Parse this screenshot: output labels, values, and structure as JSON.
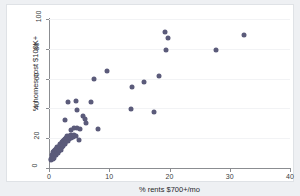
{
  "chart_data": {
    "type": "scatter",
    "title": "",
    "xlabel": "% rents $700+/mo",
    "ylabel": "% homes cost $100K+",
    "xlim": [
      0,
      40
    ],
    "ylim": [
      0,
      100
    ],
    "xticks": [
      0,
      10,
      20,
      30,
      40
    ],
    "yticks": [
      0,
      20,
      40,
      60,
      80,
      100
    ],
    "xtick_labels": [
      "0",
      "10",
      "20",
      "30",
      "40"
    ],
    "ytick_labels": [
      "0",
      "20",
      "40",
      "60",
      "80",
      "100"
    ],
    "grid": "horizontal-faint",
    "legend": "none",
    "marker_color": "#5b5b7a",
    "marker_size_px": 5,
    "points": [
      [
        0.3,
        5.5
      ],
      [
        0.4,
        6.2
      ],
      [
        0.5,
        7.0
      ],
      [
        0.5,
        8.5
      ],
      [
        0.6,
        6.0
      ],
      [
        0.6,
        9.3
      ],
      [
        0.7,
        7.6
      ],
      [
        0.7,
        10.5
      ],
      [
        0.8,
        8.2
      ],
      [
        0.8,
        11.4
      ],
      [
        0.9,
        9.0
      ],
      [
        0.9,
        6.8
      ],
      [
        1.0,
        10.0
      ],
      [
        1.0,
        12.3
      ],
      [
        1.1,
        8.8
      ],
      [
        1.1,
        11.0
      ],
      [
        1.2,
        9.6
      ],
      [
        1.2,
        13.0
      ],
      [
        1.3,
        10.8
      ],
      [
        1.3,
        12.0
      ],
      [
        1.4,
        11.6
      ],
      [
        1.4,
        14.0
      ],
      [
        1.5,
        10.2
      ],
      [
        1.5,
        12.8
      ],
      [
        1.6,
        13.6
      ],
      [
        1.6,
        11.2
      ],
      [
        1.7,
        14.4
      ],
      [
        1.7,
        12.4
      ],
      [
        1.8,
        13.2
      ],
      [
        1.8,
        15.2
      ],
      [
        1.9,
        14.0
      ],
      [
        1.9,
        16.0
      ],
      [
        2.0,
        12.0
      ],
      [
        2.0,
        15.0
      ],
      [
        2.1,
        16.5
      ],
      [
        2.1,
        13.8
      ],
      [
        2.2,
        15.6
      ],
      [
        2.2,
        17.2
      ],
      [
        2.3,
        14.6
      ],
      [
        2.3,
        16.8
      ],
      [
        2.4,
        18.0
      ],
      [
        2.4,
        15.4
      ],
      [
        2.5,
        17.5
      ],
      [
        2.5,
        19.0
      ],
      [
        2.6,
        16.2
      ],
      [
        2.6,
        18.4
      ],
      [
        2.7,
        19.6
      ],
      [
        2.7,
        17.0
      ],
      [
        2.8,
        18.8
      ],
      [
        2.8,
        20.4
      ],
      [
        2.9,
        19.2
      ],
      [
        2.9,
        17.8
      ],
      [
        3.0,
        20.0
      ],
      [
        3.0,
        21.2
      ],
      [
        3.1,
        18.2
      ],
      [
        3.2,
        20.8
      ],
      [
        3.3,
        19.4
      ],
      [
        3.4,
        21.6
      ],
      [
        3.5,
        20.2
      ],
      [
        3.6,
        22.0
      ],
      [
        3.7,
        19.8
      ],
      [
        3.8,
        21.0
      ],
      [
        4.0,
        20.6
      ],
      [
        4.2,
        22.4
      ],
      [
        4.4,
        21.4
      ],
      [
        2.6,
        32.0
      ],
      [
        3.2,
        44.6
      ],
      [
        3.6,
        25.8
      ],
      [
        4.2,
        26.8
      ],
      [
        4.4,
        45.2
      ],
      [
        4.6,
        26.6
      ],
      [
        4.7,
        39.0
      ],
      [
        5.0,
        19.0
      ],
      [
        5.2,
        26.2
      ],
      [
        5.6,
        34.8
      ],
      [
        5.9,
        32.6
      ],
      [
        6.2,
        30.4
      ],
      [
        6.9,
        44.4
      ],
      [
        7.4,
        59.4
      ],
      [
        8.1,
        26.2
      ],
      [
        9.7,
        65.4
      ],
      [
        13.6,
        39.8
      ],
      [
        13.8,
        54.6
      ],
      [
        15.7,
        57.8
      ],
      [
        17.4,
        37.4
      ],
      [
        18.2,
        62.0
      ],
      [
        19.2,
        91.6
      ],
      [
        19.5,
        79.2
      ],
      [
        19.8,
        87.2
      ],
      [
        27.8,
        79.0
      ],
      [
        32.4,
        89.4
      ]
    ]
  }
}
